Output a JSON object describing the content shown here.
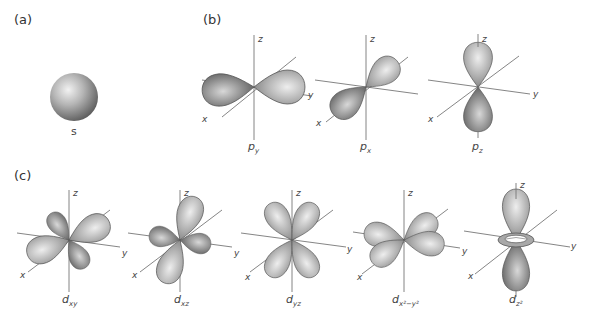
{
  "figure": {
    "panels": [
      {
        "id": "a",
        "label": "(a)"
      },
      {
        "id": "b",
        "label": "(b)"
      },
      {
        "id": "c",
        "label": "(c)"
      }
    ],
    "axes": {
      "x": "x",
      "y": "y",
      "z": "z"
    },
    "orbitals": {
      "s": {
        "name": "s",
        "sub": ""
      },
      "py": {
        "name": "p",
        "sub": "y"
      },
      "px": {
        "name": "p",
        "sub": "x"
      },
      "pz": {
        "name": "p",
        "sub": "z"
      },
      "dxy": {
        "name": "d",
        "sub": "xy"
      },
      "dxz": {
        "name": "d",
        "sub": "xz"
      },
      "dyz": {
        "name": "d",
        "sub": "yz"
      },
      "dx2y2": {
        "name": "d",
        "sub": "x²−y²"
      },
      "dz2": {
        "name": "d",
        "sub": "z²"
      }
    },
    "colors": {
      "lobe_light": "#e6e6e6",
      "lobe_mid": "#a9a9a9",
      "lobe_dark": "#5e5e5e",
      "axis": "#777777",
      "background": "#ffffff"
    }
  }
}
